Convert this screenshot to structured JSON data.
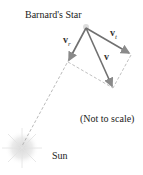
{
  "labels": {
    "star": "Barnard's Star",
    "note": "(Not to scale)",
    "sun": "Sun",
    "v_r": "v",
    "v_r_sub": "r",
    "v_t": "v",
    "v_t_sub": "t",
    "v": "v"
  },
  "colors": {
    "arrow": "#6e6e6e",
    "dashed": "#9a9a9a",
    "text": "#222222"
  }
}
